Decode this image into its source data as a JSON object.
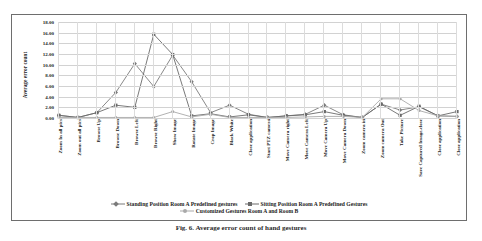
{
  "caption": "Fig. 6. Average error count of hand gestures",
  "chart_data": {
    "type": "line",
    "title": "",
    "xlabel": "",
    "ylabel": "Average  error count",
    "ylim": [
      0,
      18
    ],
    "ytick_step": 2,
    "ytick_labels": [
      "0.00",
      "2.00",
      "4.00",
      "6.00",
      "8.00",
      "10.00",
      "12.00",
      "14.00",
      "16.00",
      "18.00"
    ],
    "grid": true,
    "legend_position": "bottom",
    "categories": [
      "Zoom In all pics",
      "Zoom out all pics",
      "Browse  Up",
      "Browse  Down",
      "Browse  Left",
      "Browse  Right",
      "Show Image",
      "Rotate Image",
      "Crop Image",
      "Black White",
      "Close application",
      "Start PTZ camera",
      "Move Camera right",
      "Move Camera Left",
      "Move Camera Up",
      "Move Camera Down",
      "Zoom camera in",
      "Zoom camera Out",
      "Take Picture",
      "Save Captured Image,close",
      "Close application",
      "Close application"
    ],
    "series": [
      {
        "name": "Standing Position  Room A Predefined gestures",
        "color": "#7b7b7b",
        "marker": "diamond",
        "values": [
          0.5,
          0.1,
          1.0,
          4.8,
          10.2,
          5.9,
          11.8,
          6.8,
          1.0,
          2.4,
          0.7,
          0.1,
          0.4,
          0.7,
          2.4,
          0.6,
          0.1,
          2.6,
          1.5,
          2.1,
          0.4,
          0.3
        ]
      },
      {
        "name": "Sitting Position Room A Predefined Gestures",
        "color": "#6a6a6a",
        "marker": "square",
        "values": [
          0.5,
          0.1,
          1.0,
          2.4,
          2.0,
          15.7,
          11.9,
          0.4,
          0.8,
          0.2,
          0.6,
          0.1,
          0.4,
          0.6,
          1.2,
          0.5,
          0.1,
          2.6,
          0.5,
          2.2,
          0.4,
          1.2
        ]
      },
      {
        "name": "Customized Gestures Room A and Room B",
        "color": "#a9a9a9",
        "marker": "circle",
        "values": [
          0.1,
          0.1,
          0.1,
          0.1,
          0.1,
          0.1,
          1.2,
          0.2,
          0.7,
          0.1,
          0.1,
          0.1,
          0.1,
          0.2,
          0.3,
          0.3,
          0.1,
          3.6,
          3.6,
          1.4,
          0.4,
          0.3
        ]
      }
    ]
  }
}
